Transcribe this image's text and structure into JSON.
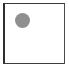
{
  "canvas": {
    "width": 69,
    "height": 69,
    "background_color": "#ffffff",
    "description": "Small square framed box containing a single gray dot marker"
  },
  "frame": {
    "name": "bounding-box",
    "inset_px": 3,
    "width": 62,
    "height": 61,
    "fill_color": "#ffffff",
    "border_color_top": "#3a3a3a",
    "border_color_left": "#2e2e2e",
    "border_color_right": "#4a4a4a",
    "border_color_bottom": "#3d3d3d",
    "border_width_px": 1.5
  },
  "markers": [
    {
      "name": "dot-marker",
      "shape": "circle",
      "center_x": 20,
      "center_y": 19,
      "diameter_px": 15,
      "color": "#8a8a8a",
      "edge": "soft",
      "quadrant": "upper-left"
    }
  ],
  "labels": {
    "alt_text": "Square outlined box with one gray filled circle in the upper left area"
  }
}
